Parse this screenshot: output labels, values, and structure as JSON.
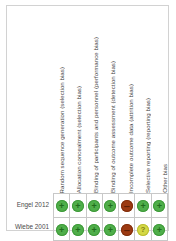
{
  "figure": {
    "type": "risk-of-bias-summary",
    "columns": [
      "Random sequence generation (selection bias)",
      "Allocation concealment (selection bias)",
      "Binding of participants and personnel (performance bias)",
      "Binding of outcome assessment (detection bias)",
      "Incomplete outcome data (attrition bias)",
      "Selective reporting (reporting bias)",
      "Other bias"
    ],
    "rows": [
      {
        "study": "Engel 2012",
        "judgements": [
          "low",
          "low",
          "low",
          "low",
          "high",
          "low",
          "low"
        ]
      },
      {
        "study": "Wiebe 2001",
        "judgements": [
          "low",
          "low",
          "low",
          "low",
          "high",
          "unclear",
          "low"
        ]
      }
    ],
    "symbols": {
      "low": {
        "glyph": "+",
        "name": "low-risk-icon",
        "color": "#4fae4a"
      },
      "high": {
        "glyph": "–",
        "name": "high-risk-icon",
        "color": "#9c3a12"
      },
      "unclear": {
        "glyph": "?",
        "name": "unclear-risk-icon",
        "color": "#d4d844"
      }
    },
    "colors": {
      "frame_border": "#d2d2d2",
      "grid_border": "#c8c8c8",
      "text": "#4a4a4a",
      "background": "#ffffff"
    }
  }
}
